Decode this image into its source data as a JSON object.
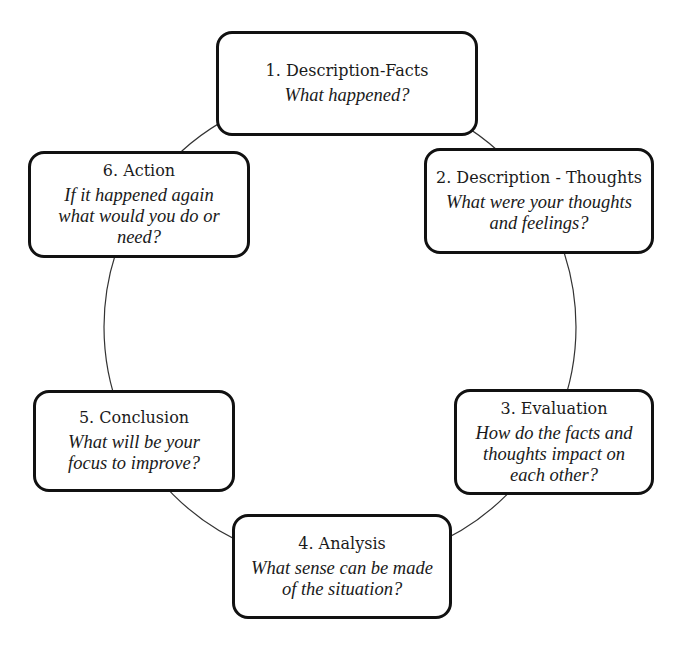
{
  "diagram": {
    "type": "cycle",
    "colors": {
      "line": "#111111",
      "circle": "#333333",
      "background": "#ffffff"
    },
    "steps": [
      {
        "id": 1,
        "title": "1. Description-Facts",
        "question": "What happened?"
      },
      {
        "id": 2,
        "title": "2. Description - Thoughts",
        "question": "What were your thoughts and feelings?"
      },
      {
        "id": 3,
        "title": "3. Evaluation",
        "question": "How do the facts and thoughts impact on each other?"
      },
      {
        "id": 4,
        "title": "4. Analysis",
        "question": "What sense can be made of the situation?"
      },
      {
        "id": 5,
        "title": "5. Conclusion",
        "question": "What will be your focus to improve?"
      },
      {
        "id": 6,
        "title": "6. Action",
        "question": "If it happened again what would you do or need?"
      }
    ]
  }
}
